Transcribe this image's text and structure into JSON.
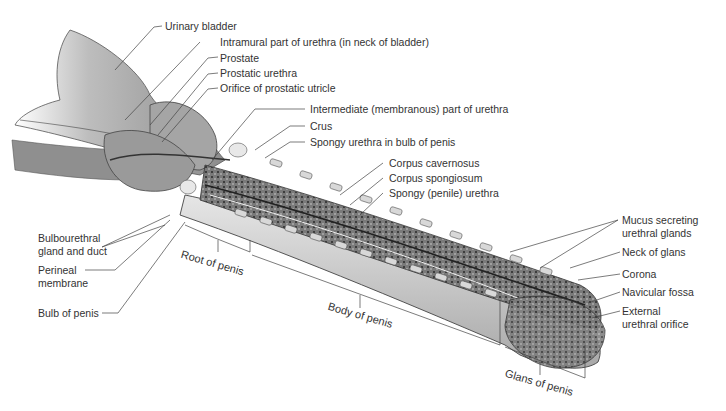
{
  "figure": {
    "colors": {
      "tissue_dark": "#5a5a5a",
      "tissue_mid": "#9a9a9a",
      "tissue_light": "#d4d4d4",
      "outline": "#333333",
      "background": "#ffffff"
    }
  },
  "labels": {
    "urinary_bladder": "Urinary bladder",
    "intramural_urethra": "Intramural part of urethra (in neck of bladder)",
    "prostate": "Prostate",
    "prostatic_urethra": "Prostatic urethra",
    "orifice_prostatic_utricle": "Orifice of prostatic utricle",
    "intermediate_urethra": "Intermediate (membranous) part of urethra",
    "crus": "Crus",
    "spongy_urethra_bulb": "Spongy urethra in bulb of penis",
    "corpus_cavernosus": "Corpus cavernosus",
    "corpus_spongiosum": "Corpus spongiosum",
    "spongy_penile_urethra": "Spongy (penile) urethra",
    "mucus_glands_1": "Mucus secreting",
    "mucus_glands_2": "urethral glands",
    "neck_of_glans": "Neck of glans",
    "corona": "Corona",
    "navicular_fossa": "Navicular fossa",
    "external_orifice_1": "External",
    "external_orifice_2": "urethral orifice",
    "bulbourethral_1": "Bulbourethral",
    "bulbourethral_2": "gland and duct",
    "perineal_1": "Perineal",
    "perineal_2": "membrane",
    "bulb_of_penis": "Bulb of penis"
  },
  "regions": {
    "root": "Root of penis",
    "body": "Body of penis",
    "glans": "Glans of penis"
  }
}
